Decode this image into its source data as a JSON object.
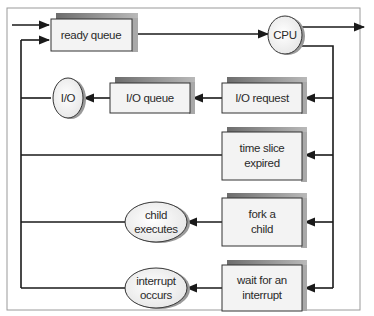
{
  "diagram": {
    "nodes": {
      "ready_queue": {
        "label": "ready queue",
        "type": "queue"
      },
      "cpu": {
        "label": "CPU",
        "type": "resource"
      },
      "io": {
        "label": "I/O",
        "type": "resource"
      },
      "io_queue": {
        "label": "I/O queue",
        "type": "queue"
      },
      "io_request": {
        "label": "I/O request",
        "type": "event"
      },
      "time_slice": {
        "line1": "time slice",
        "line2": "expired",
        "type": "event"
      },
      "fork": {
        "line1": "fork a",
        "line2": "child",
        "type": "event"
      },
      "child_exec": {
        "line1": "child",
        "line2": "executes",
        "type": "resource"
      },
      "wait_int": {
        "line1": "wait for an",
        "line2": "interrupt",
        "type": "event"
      },
      "int_occurs": {
        "line1": "interrupt",
        "line2": "occurs",
        "type": "resource"
      }
    },
    "edges": [
      [
        "entry",
        "ready_queue"
      ],
      [
        "ready_queue",
        "cpu"
      ],
      [
        "cpu",
        "exit"
      ],
      [
        "cpu",
        "io_request"
      ],
      [
        "io_request",
        "io_queue"
      ],
      [
        "io_queue",
        "io"
      ],
      [
        "io",
        "ready_queue"
      ],
      [
        "cpu",
        "time_slice"
      ],
      [
        "time_slice",
        "ready_queue"
      ],
      [
        "cpu",
        "fork"
      ],
      [
        "fork",
        "child_exec"
      ],
      [
        "child_exec",
        "ready_queue"
      ],
      [
        "cpu",
        "wait_int"
      ],
      [
        "wait_int",
        "int_occurs"
      ],
      [
        "int_occurs",
        "ready_queue"
      ]
    ],
    "colors": {
      "box_fill": "#f3f3f3",
      "box_shadow": "#8a8a8a",
      "line": "#1a1a1a",
      "frame": "#9a9a9a"
    }
  }
}
